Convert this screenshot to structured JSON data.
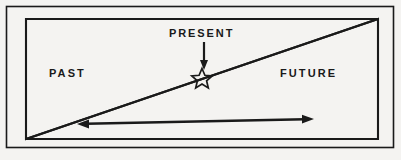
{
  "figure": {
    "type": "timeline-cone-diagram",
    "background_color": "#f4f3f1",
    "ink_color": "#1a1a1a",
    "labels": {
      "past": "PAST",
      "present": "PRESENT",
      "future": "FUTURE"
    },
    "elements": {
      "border_name": "outer-frame",
      "left_cone_name": "past-cone",
      "right_cone_name": "future-cone",
      "marker_name": "present-star-marker",
      "pointer_name": "present-pointer-arrow",
      "span_name": "span-double-arrow"
    },
    "geometry": {
      "frame": {
        "x": 6,
        "y": 6,
        "width": 388,
        "height": 142
      },
      "left_cone": [
        [
          26,
          19
        ],
        [
          26,
          139
        ],
        [
          378,
          19
        ]
      ],
      "right_cone": [
        [
          378,
          19
        ],
        [
          378,
          139
        ],
        [
          26,
          139
        ]
      ],
      "crossing_point": [
        202,
        78
      ],
      "pointer": {
        "x": 204,
        "y_start": 42,
        "y_end": 68
      },
      "span_arrow": {
        "x1": 78,
        "y1": 124,
        "x2": 313,
        "y2": 119
      }
    }
  }
}
